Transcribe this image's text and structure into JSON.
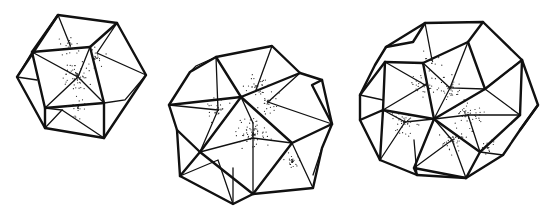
{
  "figure": {
    "panels": [
      {
        "id": "polyhedron-1",
        "label": ""
      },
      {
        "id": "polyhedron-2",
        "label": ""
      },
      {
        "id": "polyhedron-3",
        "label": ""
      }
    ],
    "colors": {
      "line": "#111111",
      "background": "#ffffff",
      "stipple": "#222222"
    }
  }
}
